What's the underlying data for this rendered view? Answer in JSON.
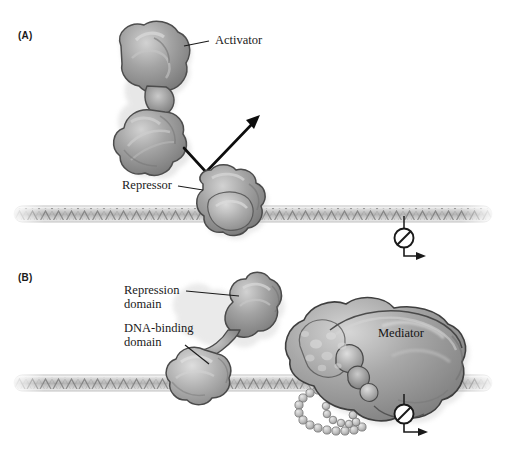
{
  "figure": {
    "background_color": "#ffffff",
    "width": 505,
    "height": 451
  },
  "panels": [
    {
      "id": "A",
      "label": "(A)",
      "label_x": 18,
      "label_y": 32,
      "description": "Repressor bound to DNA blocks activator binding; no transcription occurs."
    },
    {
      "id": "B",
      "label": "(B)",
      "label_x": 18,
      "label_y": 274,
      "description": "Repressor with DNA-binding domain and repression domain contacts Mediator complex; no transcription occurs."
    }
  ],
  "callouts": [
    {
      "name": "activator",
      "text": "Activator",
      "x": 215,
      "y": 34,
      "panel": "A",
      "leader": {
        "x1": 209,
        "y1": 42,
        "x2": 186,
        "y2": 47
      }
    },
    {
      "name": "repressor",
      "text": "Repressor",
      "x": 122,
      "y": 178,
      "panel": "A",
      "leader": {
        "x1": 180,
        "y1": 186,
        "x2": 203,
        "y2": 189
      }
    },
    {
      "name": "repression-domain",
      "text": "Repression\ndomain",
      "x": 124,
      "y": 286,
      "panel": "B",
      "leader": {
        "x1": 185,
        "y1": 292,
        "x2": 238,
        "y2": 296
      }
    },
    {
      "name": "dna-binding-domain",
      "text": "DNA-binding\ndomain",
      "x": 124,
      "y": 324,
      "panel": "B",
      "leader": {
        "x1": 186,
        "y1": 344,
        "x2": 210,
        "y2": 362
      }
    },
    {
      "name": "mediator",
      "text": "Mediator",
      "x": 378,
      "y": 327,
      "panel": "B",
      "leader": null
    }
  ],
  "molecules": {
    "activator": {
      "name": "Activator protein",
      "panel": "A",
      "shape": "two-lobed blob with narrow waist",
      "fill_top": "#9a9a9a",
      "fill_bottom": "#8e8e8e",
      "outline": "#4a4a4a"
    },
    "repressor_a": {
      "name": "Repressor protein",
      "panel": "A",
      "shape": "single compact blob on DNA",
      "fill": "#8f8f8f",
      "outline": "#4a4a4a"
    },
    "repressor_b": {
      "name": "Repressor protein with two domains",
      "panel": "B",
      "domains": [
        "DNA-binding domain",
        "Repression domain"
      ],
      "fill": "#939393",
      "outline": "#4a4a4a"
    },
    "mediator": {
      "name": "Mediator complex",
      "panel": "B",
      "shape": "large multi-lobed complex",
      "fill": "#9b9b9b",
      "outline": "#3f3f3f"
    },
    "ctd_tail": {
      "name": "Beaded chain tail",
      "panel": "B",
      "shape": "loop of small spheres",
      "bead_count": 34,
      "fill": "#bdbdbd",
      "outline": "#6a6a6a"
    }
  },
  "dna": {
    "name": "DNA double helix",
    "color_core": "#c9c9c9",
    "color_hatch": "#6f6f6f",
    "panel_a_y": 214,
    "panel_b_y": 383,
    "x_start": 14,
    "x_end": 492
  },
  "symbols": [
    {
      "name": "no-transcription-symbol",
      "panel": "A",
      "type": "prohibition-circle-with-bent-arrow",
      "circle_x": 404,
      "circle_y": 238,
      "radius": 9.5,
      "stem_top_y": 218,
      "arrow_end_x": 424,
      "arrow_y": 256,
      "color": "#1a1a1a"
    },
    {
      "name": "no-transcription-symbol",
      "panel": "B",
      "type": "prohibition-circle-with-bent-arrow",
      "circle_x": 404,
      "circle_y": 414,
      "radius": 9.5,
      "stem_top_y": 396,
      "arrow_end_x": 426,
      "arrow_y": 432,
      "color": "#1a1a1a"
    },
    {
      "name": "exclusion-arrow",
      "panel": "A",
      "type": "bent-arrow",
      "description": "V-shaped arrow from repressor pointing up-right, indicating activator exclusion",
      "points": "184,148 206,172 258,118",
      "color": "#0d0d0d"
    }
  ],
  "colors": {
    "ink": "#1a1a1a",
    "protein_mid": "#9a9a9a",
    "protein_light": "#c4c4c4",
    "protein_dark": "#6c6c6c",
    "outline": "#4a4a4a",
    "dna": "#bcbcbc",
    "background": "#ffffff"
  }
}
